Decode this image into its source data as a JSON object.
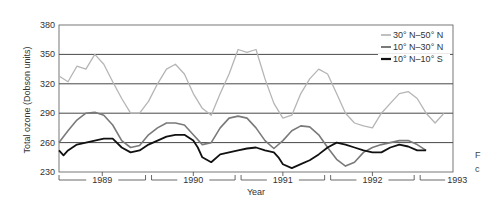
{
  "chart_data": {
    "type": "line",
    "title": "",
    "xlabel": "Year",
    "ylabel": "Total ozone (Dobson units)",
    "ylim": [
      230,
      380
    ],
    "yticks": [
      230,
      260,
      290,
      320,
      350,
      380
    ],
    "grid": true,
    "legend_position": "top-right",
    "x_ticks": [
      "1989",
      "1990",
      "1991",
      "1992",
      "1993"
    ],
    "x_range_years": [
      1988.6,
      1993.0
    ],
    "series": [
      {
        "name": "30° N–50° N",
        "color": "#b5b5b5",
        "width": 1.3,
        "x": [
          1988.6,
          1988.7,
          1988.8,
          1988.9,
          1989.0,
          1989.1,
          1989.2,
          1989.3,
          1989.4,
          1989.5,
          1989.6,
          1989.7,
          1989.8,
          1989.9,
          1990.0,
          1990.1,
          1990.2,
          1990.3,
          1990.4,
          1990.5,
          1990.6,
          1990.7,
          1990.8,
          1990.9,
          1991.0,
          1991.1,
          1991.2,
          1991.3,
          1991.4,
          1991.5,
          1991.6,
          1991.7,
          1991.8,
          1991.9,
          1992.0,
          1992.1,
          1992.2,
          1992.3,
          1992.4,
          1992.5,
          1992.6,
          1992.7,
          1992.8,
          1992.9
        ],
        "values": [
          328,
          322,
          338,
          335,
          350,
          340,
          322,
          305,
          290,
          290,
          302,
          320,
          335,
          340,
          330,
          310,
          295,
          288,
          310,
          330,
          355,
          352,
          355,
          325,
          300,
          285,
          288,
          310,
          325,
          335,
          330,
          310,
          290,
          280,
          277,
          275,
          290,
          300,
          310,
          312,
          305,
          290,
          280,
          290
        ]
      },
      {
        "name": "10° N–30° N",
        "color": "#7a7a7a",
        "width": 1.6,
        "x": [
          1988.6,
          1988.7,
          1988.8,
          1988.9,
          1989.0,
          1989.1,
          1989.2,
          1989.3,
          1989.4,
          1989.5,
          1989.6,
          1989.7,
          1989.8,
          1989.9,
          1990.0,
          1990.1,
          1990.2,
          1990.3,
          1990.4,
          1990.5,
          1990.6,
          1990.7,
          1990.8,
          1990.9,
          1991.0,
          1991.1,
          1991.2,
          1991.3,
          1991.4,
          1991.5,
          1991.6,
          1991.7,
          1991.8,
          1991.9,
          1992.0,
          1992.1,
          1992.2,
          1992.3,
          1992.4,
          1992.5,
          1992.6,
          1992.7
        ],
        "values": [
          260,
          272,
          283,
          290,
          291,
          288,
          278,
          262,
          255,
          257,
          268,
          275,
          280,
          280,
          278,
          268,
          258,
          260,
          275,
          285,
          287,
          285,
          275,
          262,
          254,
          262,
          272,
          277,
          276,
          268,
          255,
          243,
          236,
          240,
          250,
          255,
          258,
          260,
          262,
          262,
          258,
          252
        ]
      },
      {
        "name": "10° N–10° S",
        "color": "#111111",
        "width": 1.8,
        "x": [
          1988.6,
          1988.65,
          1988.7,
          1988.8,
          1988.9,
          1989.0,
          1989.1,
          1989.2,
          1989.3,
          1989.4,
          1989.5,
          1989.6,
          1989.7,
          1989.8,
          1989.9,
          1990.0,
          1990.1,
          1990.15,
          1990.2,
          1990.3,
          1990.4,
          1990.5,
          1990.6,
          1990.7,
          1990.8,
          1990.9,
          1991.0,
          1991.05,
          1991.1,
          1991.2,
          1991.3,
          1991.4,
          1991.5,
          1991.6,
          1991.7,
          1991.8,
          1991.9,
          1992.0,
          1992.1,
          1992.2,
          1992.3,
          1992.4,
          1992.5,
          1992.6,
          1992.7
        ],
        "values": [
          252,
          247,
          252,
          258,
          260,
          262,
          264,
          264,
          255,
          250,
          252,
          258,
          262,
          266,
          268,
          268,
          262,
          255,
          245,
          240,
          248,
          250,
          252,
          254,
          255,
          252,
          250,
          245,
          238,
          234,
          238,
          242,
          248,
          255,
          260,
          258,
          255,
          252,
          250,
          250,
          255,
          258,
          256,
          252,
          252
        ]
      }
    ]
  },
  "axis": {
    "ylabel": "Total ozone (Dobson units)",
    "xlabel": "Year"
  },
  "legend": [
    {
      "label": "30° N–50° N"
    },
    {
      "label": "10° N–30° N"
    },
    {
      "label": "10° N–10° S"
    }
  ],
  "edge_text": [
    "F",
    "c"
  ]
}
